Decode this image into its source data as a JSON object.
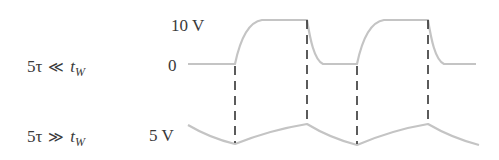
{
  "rows": [
    {
      "condition": {
        "lhs": "5τ",
        "relation": "≪",
        "var": "t",
        "sub": "W"
      },
      "axis_labels": {
        "high": "10 V",
        "low": "0"
      }
    },
    {
      "condition": {
        "lhs": "5τ",
        "relation": "≫",
        "var": "t",
        "sub": "W"
      },
      "axis_labels": {
        "level": "5 V"
      }
    }
  ],
  "colors": {
    "waveform": "#c4c4c4",
    "dashed": "#333333",
    "text": "#3a3a3a"
  },
  "waveforms": {
    "top": {
      "description": "RC response, fully charges and discharges (5τ ≪ tW)",
      "low_v": 0,
      "high_v": 10
    },
    "bottom": {
      "description": "RC response, partial charging around 5 V average (5τ ≫ tW)",
      "center_v": 5
    }
  },
  "transitions_x": [
    235,
    307,
    357,
    428
  ]
}
